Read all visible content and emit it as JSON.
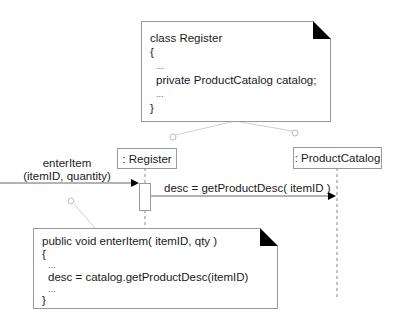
{
  "diagram": {
    "type": "UML interaction diagram with code notes",
    "top_note": {
      "lines": [
        "class Register",
        "{",
        "...",
        "private ProductCatalog catalog;",
        "...",
        "}"
      ]
    },
    "bottom_note": {
      "lines": [
        "public void enterItem( itemID, qty )",
        "{",
        "...",
        "desc = catalog.getProductDesc(itemID)",
        "...",
        "}"
      ]
    },
    "lifelines": [
      {
        "label": ": Register"
      },
      {
        "label": ": ProductCatalog"
      }
    ],
    "messages": [
      {
        "line1": "enterItem",
        "line2": "(itemID, quantity)"
      },
      {
        "label": "desc = getProductDesc( itemID )"
      }
    ],
    "colors": {
      "border": "#9a9a9a",
      "text": "#1a1a1a",
      "fold": "#000000",
      "connector": "#cccccc"
    }
  }
}
